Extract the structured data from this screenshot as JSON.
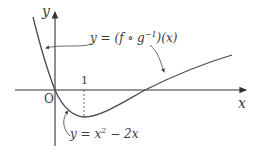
{
  "diagram": {
    "axes": {
      "x_label": "x",
      "y_label": "y",
      "origin_label": "O",
      "tick_x": "1"
    },
    "curves": {
      "composite": {
        "label_prefix": "y = (f ∘ g",
        "label_sup": "−1",
        "label_suffix": ")(x)"
      },
      "parabola": {
        "label_prefix": "y = x",
        "label_sup": "2",
        "label_suffix": " − 2x"
      }
    },
    "colors": {
      "stroke": "#4a4a4a",
      "text": "#3a3a3a",
      "background": "#ffffff"
    }
  }
}
